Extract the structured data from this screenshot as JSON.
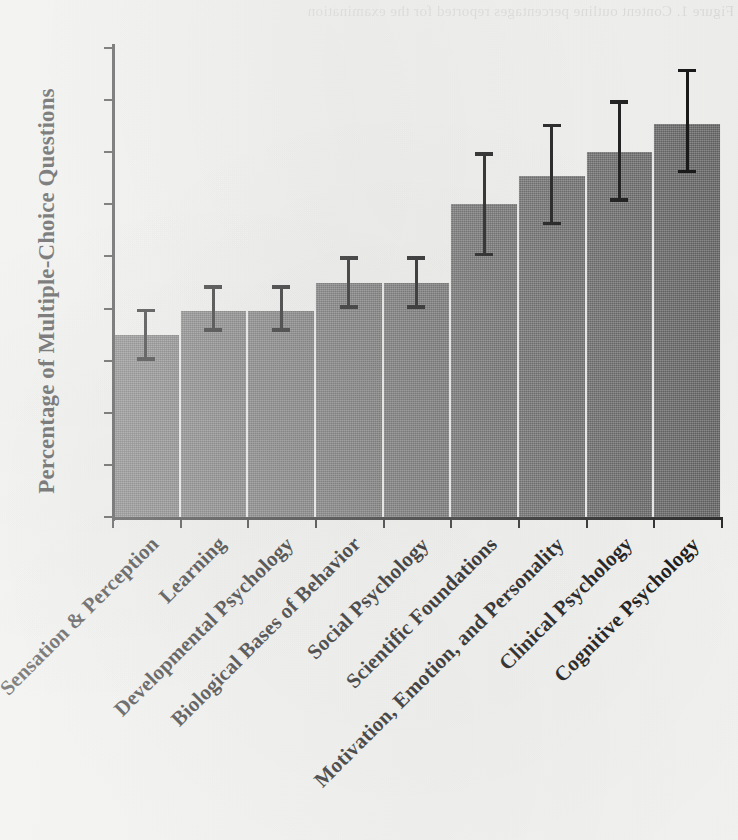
{
  "figure": {
    "background_color": "#f3f3f1",
    "bar_color": "#6f6f6f",
    "error_bar_color": "#0e0e0e",
    "axis_color": "#2a2a2a",
    "bleed_through_text": "Figure 1. Content outline percentages reported for the examination"
  },
  "chart_data": {
    "type": "bar",
    "title": "",
    "subtitle": "",
    "xlabel": "",
    "ylabel": "Percentage of Multiple-Choice Questions",
    "ylim": [
      0,
      18
    ],
    "ytick_labels": [
      "0",
      "2",
      "4",
      "6",
      "8",
      "10",
      "12",
      "14",
      "16",
      "18"
    ],
    "ytick_values": [
      0,
      2,
      4,
      6,
      8,
      10,
      12,
      14,
      16,
      18
    ],
    "grid": false,
    "legend": null,
    "error_bar_type": "confidence-interval",
    "categories": [
      "Sensation & Perception",
      "Learning",
      "Developmental Psychology",
      "Biological Bases of Behavior",
      "Social Psychology",
      "Scientific Foundations",
      "Motivation, Emotion, and Personality",
      "Clinical Psychology",
      "Cognitive Psychology"
    ],
    "values": [
      7.0,
      7.9,
      7.9,
      9.0,
      9.0,
      12.0,
      13.1,
      14.0,
      15.1
    ],
    "error_low": [
      6.0,
      7.1,
      7.1,
      8.0,
      8.0,
      10.0,
      11.2,
      12.1,
      13.2
    ],
    "error_high": [
      8.0,
      8.9,
      8.9,
      10.0,
      10.0,
      14.0,
      15.1,
      16.0,
      17.2
    ]
  }
}
